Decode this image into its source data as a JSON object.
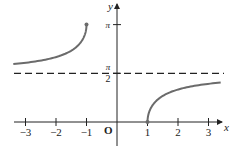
{
  "chart_data": {
    "type": "line",
    "title": "",
    "xlabel": "x",
    "ylabel": "y",
    "origin_label": "O",
    "xlim": [
      -3.4,
      3.4
    ],
    "ylim": [
      -0.7,
      3.8
    ],
    "x_ticks": [
      {
        "value": -3,
        "label": "−3"
      },
      {
        "value": -2,
        "label": "−2"
      },
      {
        "value": -1,
        "label": "−1"
      },
      {
        "value": 1,
        "label": "1"
      },
      {
        "value": 2,
        "label": "2"
      },
      {
        "value": 3,
        "label": "3"
      }
    ],
    "y_ticks": [
      {
        "value": 3.14159,
        "label": "π"
      },
      {
        "value": 1.5708,
        "label_num": "π",
        "label_den": "2"
      }
    ],
    "asymptote": {
      "y": 1.5708,
      "style": "dashed",
      "label": "π/2"
    },
    "series": [
      {
        "name": "left branch",
        "x": [
          -3.4,
          -3,
          -2.5,
          -2,
          -1.5,
          -1.2,
          -1.05,
          -1
        ],
        "y": [
          1.875,
          1.911,
          1.982,
          2.094,
          2.301,
          2.556,
          2.831,
          3.14159
        ],
        "endpoint": {
          "x": -1,
          "y": 3.14159,
          "filled": true
        }
      },
      {
        "name": "right branch",
        "x": [
          1,
          1.05,
          1.2,
          1.5,
          2,
          2.5,
          3,
          3.4
        ],
        "y": [
          0,
          0.311,
          0.586,
          0.841,
          1.047,
          1.159,
          1.231,
          1.266
        ],
        "endpoint": {
          "x": 1,
          "y": 0,
          "filled": true
        }
      }
    ],
    "grid": false,
    "legend": null,
    "colors": {
      "curve": "#6b6b6b",
      "axes": "#222222",
      "dashed": "#222222"
    }
  }
}
